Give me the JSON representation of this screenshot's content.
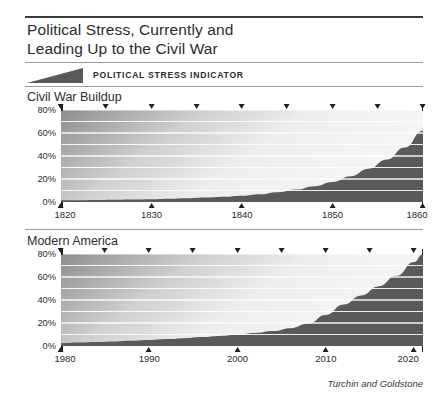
{
  "title": {
    "line1": "Political Stress, Currently and",
    "line2": "Leading Up to the Civil War"
  },
  "legend": {
    "icon": "wedge-icon",
    "label": "POLITICAL STRESS INDICATOR",
    "color": "#595959"
  },
  "source": "Turchin and Goldstone",
  "colors": {
    "curve_fill": "#5a5a5a",
    "background_top": "#f4f4f4",
    "background_left": "#8f8f8f",
    "gridline": "#ffffff",
    "axis": "#231f20"
  },
  "panels": [
    {
      "heading": "Civil War Buildup",
      "ylabels": [
        "80%",
        "60%",
        "40%",
        "20%",
        "0%"
      ],
      "xlabels": [
        "1820",
        "1830",
        "1840",
        "1850",
        "1860"
      ]
    },
    {
      "heading": "Modern America",
      "ylabels": [
        "80%",
        "60%",
        "40%",
        "20%",
        "0%"
      ],
      "xlabels": [
        "1980",
        "1990",
        "2000",
        "2010",
        "2020"
      ]
    }
  ],
  "chart_data": [
    {
      "type": "area",
      "title": "Civil War Buildup",
      "xlabel": "",
      "ylabel": "Political stress indicator (%)",
      "xlim": [
        1820,
        1860
      ],
      "ylim": [
        0,
        80
      ],
      "ytick_values": [
        0,
        20,
        40,
        60,
        80
      ],
      "ytick_labels": [
        "0%",
        "20%",
        "40%",
        "60%",
        "80%"
      ],
      "xtick_values": [
        1820,
        1830,
        1840,
        1850,
        1860
      ],
      "xtick_labels": [
        "1820",
        "1830",
        "1840",
        "1850",
        "1860"
      ],
      "xminor_values": [
        1825,
        1835,
        1845,
        1855
      ],
      "grid": true,
      "gridline_values": [
        10,
        20,
        30,
        40,
        50,
        60,
        70
      ],
      "x": [
        1820,
        1822,
        1824,
        1826,
        1828,
        1830,
        1832,
        1834,
        1836,
        1838,
        1840,
        1842,
        1844,
        1846,
        1848,
        1850,
        1852,
        1854,
        1856,
        1858,
        1860
      ],
      "values": [
        1.5,
        1.6,
        1.8,
        2.0,
        2.2,
        2.5,
        2.9,
        3.3,
        3.9,
        4.6,
        5.5,
        6.8,
        8.5,
        10.8,
        13.8,
        17.5,
        22.5,
        29.0,
        37.0,
        47.5,
        62.0
      ]
    },
    {
      "type": "area",
      "title": "Modern America",
      "xlabel": "",
      "ylabel": "Political stress indicator (%)",
      "xlim": [
        1980,
        2021
      ],
      "ylim": [
        0,
        80
      ],
      "ytick_values": [
        0,
        20,
        40,
        60,
        80
      ],
      "ytick_labels": [
        "0%",
        "20%",
        "40%",
        "60%",
        "80%"
      ],
      "xtick_values": [
        1980,
        1990,
        2000,
        2010,
        2020
      ],
      "xtick_labels": [
        "1980",
        "1990",
        "2000",
        "2010",
        "2020"
      ],
      "xminor_values": [
        1985,
        1995,
        2005,
        2015
      ],
      "grid": true,
      "gridline_values": [
        10,
        20,
        30,
        40,
        50,
        60,
        70
      ],
      "x": [
        1980,
        1982,
        1984,
        1986,
        1988,
        1990,
        1992,
        1994,
        1996,
        1998,
        2000,
        2002,
        2004,
        2006,
        2008,
        2010,
        2012,
        2014,
        2016,
        2018,
        2020,
        2021
      ],
      "values": [
        2.5,
        3.0,
        3.5,
        4.0,
        4.6,
        5.2,
        6.0,
        6.8,
        7.8,
        8.8,
        10.0,
        11.3,
        13.0,
        15.5,
        19.5,
        27.0,
        36.0,
        44.0,
        52.0,
        61.0,
        73.0,
        80.0
      ]
    }
  ]
}
